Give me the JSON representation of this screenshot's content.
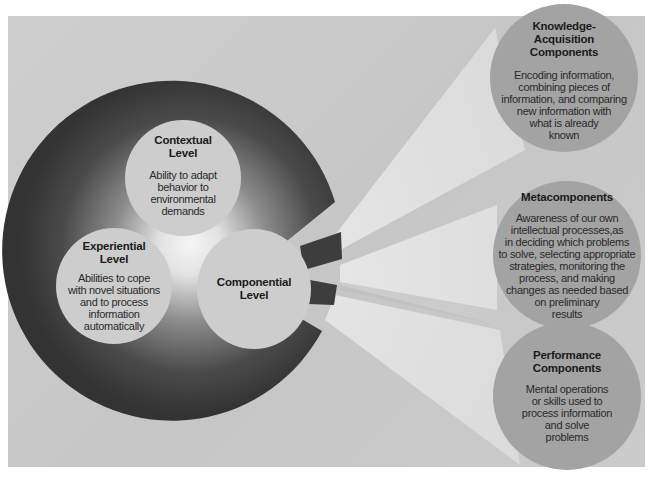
{
  "diagram": {
    "main_circle": {
      "levels": [
        {
          "id": "contextual",
          "title": "Contextual\nLevel",
          "description": "Ability to adapt\nbehavior to\nenvironmental\ndemands"
        },
        {
          "id": "experiential",
          "title": "Experiential\nLevel",
          "description": "Abilities to cope\nwith novel situations\nand to process\ninformation\nautomatically"
        },
        {
          "id": "componential",
          "title": "Componential\nLevel",
          "description": ""
        }
      ]
    },
    "components": [
      {
        "id": "knowledge-acquisition",
        "title": "Knowledge-\nAcquisition\nComponents",
        "description": "Encoding information,\ncombining pieces of\ninformation, and comparing\nnew information with\nwhat is already\nknown"
      },
      {
        "id": "metacomponents",
        "title": "Metacomponents",
        "description": "Awareness of our own\nintellectual processes,as\nin deciding which problems\nto solve, selecting appropriate\nstrategies, monitoring the\nprocess, and making\nchanges as needed based\non preliminary\nresults"
      },
      {
        "id": "performance",
        "title": "Performance\nComponents",
        "description": "Mental operations\nor skills used to\nprocess information\nand solve\nproblems"
      }
    ],
    "colors": {
      "panel": "#c9c9c9",
      "ring_dark": "#3a3a3a",
      "ring_center": "#f4f4f4",
      "inner_circle": "#cdcdcd",
      "component_circle": "#a3a3a3",
      "beam": "#dedede"
    }
  }
}
